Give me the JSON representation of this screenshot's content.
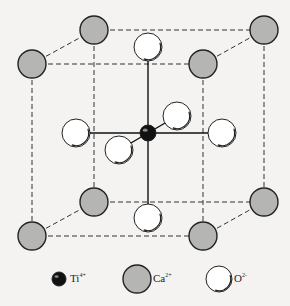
{
  "colors": {
    "background": "#f4f3f1",
    "ti_fill": "#111111",
    "ca_fill": "#b5b5b3",
    "o_fill": "#ffffff",
    "stroke": "#222222"
  },
  "legend": [
    {
      "ion": "Ti",
      "charge": "4+",
      "icon": "ti-ion-icon"
    },
    {
      "ion": "Ca",
      "charge": "2+",
      "icon": "ca-ion-icon"
    },
    {
      "ion": "O",
      "charge": "2-",
      "icon": "o-ion-icon"
    }
  ],
  "atoms": {
    "ca": [
      "front-top-left",
      "back-top-left",
      "back-top-right",
      "front-top-right",
      "back-bottom-left",
      "front-bottom-left",
      "back-bottom-right",
      "front-bottom-right"
    ],
    "ti": [
      "center"
    ],
    "o": [
      "top",
      "bottom",
      "left",
      "right",
      "back",
      "front"
    ]
  }
}
